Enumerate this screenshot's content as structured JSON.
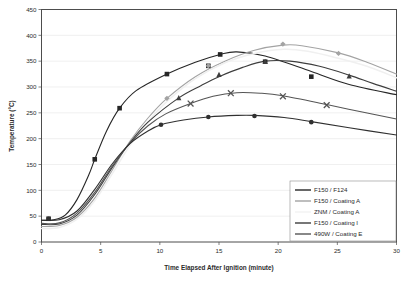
{
  "chart_data": {
    "type": "line",
    "title": "",
    "xlabel": "Time Elapsed After Ignition (minute)",
    "ylabel": "Temperature (°C)",
    "xlim": [
      0,
      30
    ],
    "ylim": [
      0,
      450
    ],
    "xticks": [
      0,
      5,
      10,
      15,
      20,
      25,
      30
    ],
    "yticks": [
      0,
      50,
      100,
      150,
      200,
      250,
      300,
      350,
      400,
      450
    ],
    "grid": "horizontal",
    "legend_position": "inside-bottom-right",
    "series": [
      {
        "name": "F150 / F124",
        "color": "#262626",
        "marker": "square",
        "points": [
          {
            "x": 0.6,
            "y": 45
          },
          {
            "x": 4.5,
            "y": 160
          },
          {
            "x": 6.6,
            "y": 259
          },
          {
            "x": 10.6,
            "y": 325
          },
          {
            "x": 14.1,
            "y": 341
          },
          {
            "x": 15.1,
            "y": 363
          },
          {
            "x": 18.9,
            "y": 349
          },
          {
            "x": 22.8,
            "y": 320
          }
        ],
        "curve": [
          {
            "x": 0.0,
            "y": 42
          },
          {
            "x": 1.0,
            "y": 43
          },
          {
            "x": 2.0,
            "y": 52
          },
          {
            "x": 3.0,
            "y": 82
          },
          {
            "x": 4.0,
            "y": 130
          },
          {
            "x": 4.5,
            "y": 160
          },
          {
            "x": 5.5,
            "y": 215
          },
          {
            "x": 6.6,
            "y": 259
          },
          {
            "x": 8.0,
            "y": 293
          },
          {
            "x": 10.6,
            "y": 325
          },
          {
            "x": 13.0,
            "y": 348
          },
          {
            "x": 15.1,
            "y": 363
          },
          {
            "x": 16.5,
            "y": 368
          },
          {
            "x": 18.9,
            "y": 360
          },
          {
            "x": 22.8,
            "y": 330
          },
          {
            "x": 26.0,
            "y": 305
          },
          {
            "x": 30.0,
            "y": 285
          }
        ]
      },
      {
        "name": "F150 / Coating A",
        "color": "#a3a3a3",
        "marker": "diamond",
        "points": [
          {
            "x": 10.6,
            "y": 278
          },
          {
            "x": 14.1,
            "y": 341
          },
          {
            "x": 20.4,
            "y": 383
          },
          {
            "x": 25.1,
            "y": 365
          }
        ],
        "curve": [
          {
            "x": 0.0,
            "y": 30
          },
          {
            "x": 1.5,
            "y": 32
          },
          {
            "x": 3.0,
            "y": 48
          },
          {
            "x": 4.5,
            "y": 85
          },
          {
            "x": 6.0,
            "y": 140
          },
          {
            "x": 7.5,
            "y": 196
          },
          {
            "x": 9.0,
            "y": 240
          },
          {
            "x": 10.6,
            "y": 278
          },
          {
            "x": 13.0,
            "y": 320
          },
          {
            "x": 15.5,
            "y": 350
          },
          {
            "x": 18.0,
            "y": 371
          },
          {
            "x": 20.4,
            "y": 381
          },
          {
            "x": 22.0,
            "y": 380
          },
          {
            "x": 25.1,
            "y": 366
          },
          {
            "x": 27.5,
            "y": 348
          },
          {
            "x": 30.0,
            "y": 325
          }
        ]
      },
      {
        "name": "ZNM / Coating A",
        "color": "#f0f0f0",
        "marker": "none",
        "points": [],
        "curve": [
          {
            "x": 0.0,
            "y": 26
          },
          {
            "x": 1.5,
            "y": 28
          },
          {
            "x": 3.0,
            "y": 44
          },
          {
            "x": 4.5,
            "y": 80
          },
          {
            "x": 6.0,
            "y": 133
          },
          {
            "x": 7.5,
            "y": 188
          },
          {
            "x": 9.0,
            "y": 233
          },
          {
            "x": 10.6,
            "y": 272
          },
          {
            "x": 13.0,
            "y": 316
          },
          {
            "x": 15.5,
            "y": 347
          },
          {
            "x": 18.0,
            "y": 365
          },
          {
            "x": 20.5,
            "y": 373
          },
          {
            "x": 22.5,
            "y": 369
          },
          {
            "x": 25.0,
            "y": 356
          },
          {
            "x": 27.5,
            "y": 340
          },
          {
            "x": 30.0,
            "y": 318
          }
        ]
      },
      {
        "name": "F150 / Coating I",
        "color": "#3d3d3d",
        "marker": "triangle",
        "points": [
          {
            "x": 11.6,
            "y": 279
          },
          {
            "x": 15.0,
            "y": 324
          },
          {
            "x": 18.9,
            "y": 349
          },
          {
            "x": 26.0,
            "y": 321
          }
        ],
        "curve": [
          {
            "x": 0.0,
            "y": 34
          },
          {
            "x": 1.5,
            "y": 35
          },
          {
            "x": 3.0,
            "y": 52
          },
          {
            "x": 4.5,
            "y": 92
          },
          {
            "x": 6.0,
            "y": 145
          },
          {
            "x": 7.5,
            "y": 193
          },
          {
            "x": 9.0,
            "y": 232
          },
          {
            "x": 11.6,
            "y": 279
          },
          {
            "x": 13.5,
            "y": 303
          },
          {
            "x": 15.0,
            "y": 320
          },
          {
            "x": 17.0,
            "y": 338
          },
          {
            "x": 18.9,
            "y": 350
          },
          {
            "x": 21.0,
            "y": 350
          },
          {
            "x": 23.5,
            "y": 340
          },
          {
            "x": 26.0,
            "y": 323
          },
          {
            "x": 28.0,
            "y": 307
          },
          {
            "x": 30.0,
            "y": 292
          }
        ]
      },
      {
        "name": "490W / Coating E",
        "color": "#555555",
        "marker": "cross",
        "points": [
          {
            "x": 12.6,
            "y": 268
          },
          {
            "x": 16.0,
            "y": 288
          },
          {
            "x": 20.4,
            "y": 282
          },
          {
            "x": 24.1,
            "y": 265
          }
        ],
        "curve": [
          {
            "x": 0.0,
            "y": 36
          },
          {
            "x": 1.5,
            "y": 37
          },
          {
            "x": 3.0,
            "y": 56
          },
          {
            "x": 4.5,
            "y": 96
          },
          {
            "x": 6.0,
            "y": 148
          },
          {
            "x": 7.5,
            "y": 192
          },
          {
            "x": 9.0,
            "y": 225
          },
          {
            "x": 10.5,
            "y": 248
          },
          {
            "x": 12.6,
            "y": 268
          },
          {
            "x": 14.5,
            "y": 282
          },
          {
            "x": 16.5,
            "y": 289
          },
          {
            "x": 18.5,
            "y": 288
          },
          {
            "x": 20.4,
            "y": 283
          },
          {
            "x": 24.1,
            "y": 266
          },
          {
            "x": 27.0,
            "y": 252
          },
          {
            "x": 30.0,
            "y": 238
          }
        ]
      },
      {
        "name": "unlabeled-lowest",
        "color": "#303030",
        "marker": "circle",
        "points": [
          {
            "x": 0.6,
            "y": 45
          },
          {
            "x": 10.1,
            "y": 227
          },
          {
            "x": 14.1,
            "y": 242
          },
          {
            "x": 18.0,
            "y": 244
          },
          {
            "x": 22.8,
            "y": 232
          }
        ],
        "curve": [
          {
            "x": 0.0,
            "y": 42
          },
          {
            "x": 1.5,
            "y": 43
          },
          {
            "x": 3.0,
            "y": 60
          },
          {
            "x": 4.5,
            "y": 102
          },
          {
            "x": 6.0,
            "y": 152
          },
          {
            "x": 7.5,
            "y": 191
          },
          {
            "x": 9.0,
            "y": 215
          },
          {
            "x": 10.1,
            "y": 227
          },
          {
            "x": 12.0,
            "y": 236
          },
          {
            "x": 14.1,
            "y": 242
          },
          {
            "x": 16.5,
            "y": 245
          },
          {
            "x": 18.0,
            "y": 245
          },
          {
            "x": 20.5,
            "y": 241
          },
          {
            "x": 22.8,
            "y": 233
          },
          {
            "x": 26.0,
            "y": 221
          },
          {
            "x": 30.0,
            "y": 207
          }
        ]
      }
    ],
    "legend_entries": [
      {
        "label": "F150 / F124",
        "color": "#262626"
      },
      {
        "label": "F150 / Coating A",
        "color": "#a3a3a3"
      },
      {
        "label": "ZNM / Coating A",
        "color": "#f2f2f2"
      },
      {
        "label": "F150 / Coating I",
        "color": "#3d3d3d"
      },
      {
        "label": "490W / Coating E",
        "color": "#555555"
      }
    ]
  },
  "axes": {
    "y_tick_labels": [
      "0",
      "50",
      "100",
      "150",
      "200",
      "250",
      "300",
      "350",
      "400",
      "450"
    ],
    "x_tick_labels": [
      "0",
      "5",
      "10",
      "15",
      "20",
      "25",
      "30"
    ],
    "x_title": "Time Elapsed After Ignition (minute)",
    "y_title": "Temperature (°C)"
  },
  "caption": {
    "fragment": ""
  }
}
